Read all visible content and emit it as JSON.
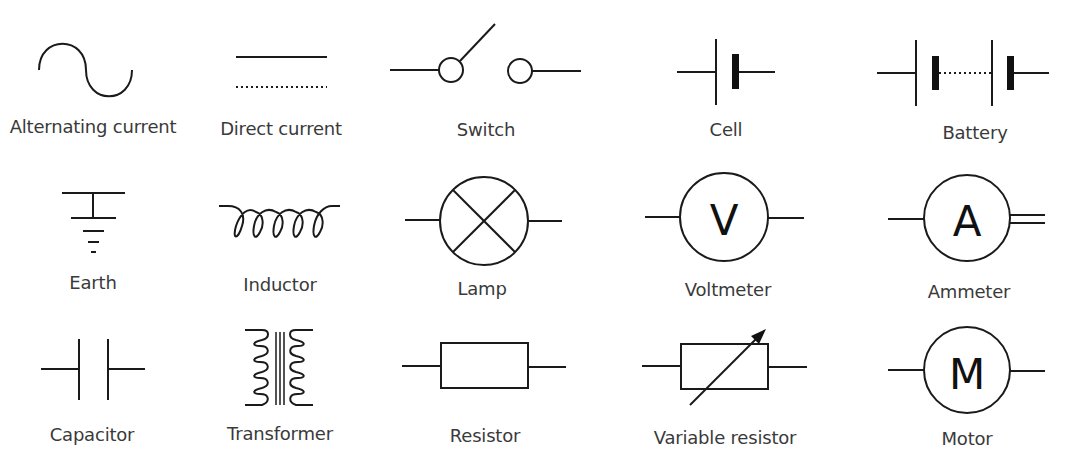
{
  "symbols": [
    {
      "id": "alternating-current",
      "label": "Alternating current",
      "row": 1,
      "col": 1
    },
    {
      "id": "direct-current",
      "label": "Direct current",
      "row": 1,
      "col": 2
    },
    {
      "id": "switch",
      "label": "Switch",
      "row": 1,
      "col": 3
    },
    {
      "id": "cell",
      "label": "Cell",
      "row": 1,
      "col": 4
    },
    {
      "id": "battery",
      "label": "Battery",
      "row": 1,
      "col": 5
    },
    {
      "id": "earth",
      "label": "Earth",
      "row": 2,
      "col": 1
    },
    {
      "id": "inductor",
      "label": "Inductor",
      "row": 2,
      "col": 2
    },
    {
      "id": "lamp",
      "label": "Lamp",
      "row": 2,
      "col": 3
    },
    {
      "id": "voltmeter",
      "label": "Voltmeter",
      "row": 2,
      "col": 4,
      "glyph": "V"
    },
    {
      "id": "ammeter",
      "label": "Ammeter",
      "row": 2,
      "col": 5,
      "glyph": "A"
    },
    {
      "id": "capacitor",
      "label": "Capacitor",
      "row": 3,
      "col": 1
    },
    {
      "id": "transformer",
      "label": "Transformer",
      "row": 3,
      "col": 2
    },
    {
      "id": "resistor",
      "label": "Resistor",
      "row": 3,
      "col": 3
    },
    {
      "id": "variable-resistor",
      "label": "Variable resistor",
      "row": 3,
      "col": 4
    },
    {
      "id": "motor",
      "label": "Motor",
      "row": 3,
      "col": 5,
      "glyph": "M"
    }
  ],
  "colors": {
    "stroke": "#1a1a1a",
    "label": "#3a3a3a",
    "background": "#ffffff"
  }
}
